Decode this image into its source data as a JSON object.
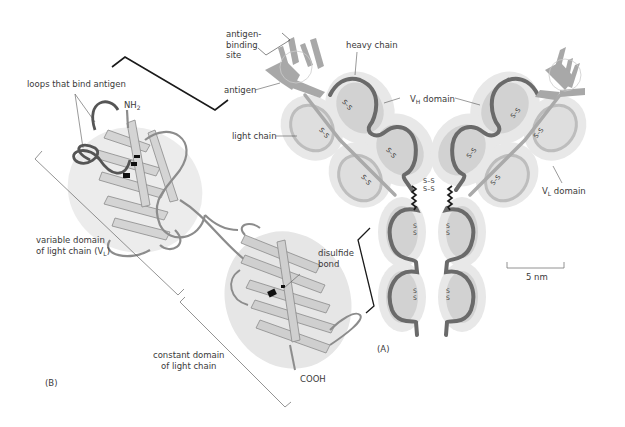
{
  "figure": {
    "panel_a_label": "(A)",
    "panel_b_label": "(B)"
  },
  "panel_a": {
    "labels": {
      "antigen_binding_site": "antigen-\nbinding\nsite",
      "antigen": "antigen",
      "heavy_chain": "heavy chain",
      "light_chain": "light chain",
      "vh_domain_prefix": "V",
      "vh_domain_sub": "H",
      "vh_domain_suffix": " domain",
      "vl_domain_prefix": "V",
      "vl_domain_sub": "L",
      "vl_domain_suffix": " domain",
      "disulfide_mark": "S–S",
      "disulfide_vertical": "S\nS"
    },
    "scale_bar": {
      "label": "5 nm"
    },
    "colors": {
      "chain_dark": "#6e6e6e",
      "domain_fill": "#d6d6d6",
      "halo": "#e6e6e6",
      "light_chain": "#bdbdbd",
      "antigen": "#a9a9a9"
    }
  },
  "panel_b": {
    "labels": {
      "loops": "loops that bind antigen",
      "nh2_prefix": "NH",
      "nh2_sub": "2",
      "variable_domain_line1": "variable domain",
      "variable_domain_line2_prefix": "of light chain (V",
      "variable_domain_line2_sub": "L",
      "variable_domain_line2_suffix": ")",
      "disulfide_bond": "disulfide\nbond",
      "constant_domain": "constant domain\nof light chain",
      "cooh": "COOH"
    },
    "colors": {
      "ribbon": "#c8c8c8",
      "ribbon_edge": "#8a8a8a",
      "loop": "#7a7a7a",
      "ellipse": "#e8e8e8",
      "bond": "#111111"
    }
  }
}
